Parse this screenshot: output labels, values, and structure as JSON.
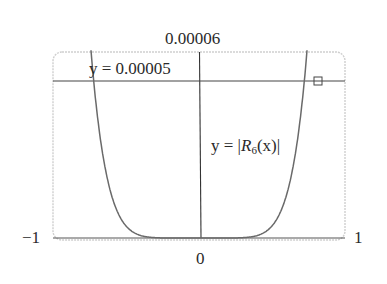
{
  "chart_data": {
    "type": "line",
    "title": "",
    "xlabel": "",
    "ylabel": "",
    "xlim": [
      -1,
      1
    ],
    "ylim": [
      0,
      6e-05
    ],
    "grid": false,
    "tick_labels": {
      "x_left": "−1",
      "x_right": "1",
      "x_origin": "0",
      "y_top": "0.00006"
    },
    "series": [
      {
        "name": "y = |R6(x)|",
        "label_prefix": "y = |",
        "label_R": "R",
        "label_sub": "6",
        "label_suffix": "(x)|",
        "x": [
          -0.75,
          -0.7,
          -0.6,
          -0.5,
          -0.4,
          -0.3,
          -0.2,
          -0.1,
          0,
          0.1,
          0.2,
          0.3,
          0.4,
          0.5,
          0.6,
          0.7,
          0.75
        ],
        "y": [
          6e-05,
          4.3e-05,
          2.15e-05,
          9.7e-06,
          4e-06,
          1.3e-06,
          2.5e-07,
          1e-08,
          0,
          1e-08,
          2.5e-07,
          1.3e-06,
          4e-06,
          9.7e-06,
          2.15e-05,
          4.3e-05,
          6e-05
        ]
      },
      {
        "name": "y = 0.00005",
        "label": "y = 0.00005",
        "x": [
          -1,
          1
        ],
        "y": [
          5e-05,
          5e-05
        ]
      }
    ],
    "annotations": [
      {
        "type": "intersection-marker",
        "x": 0.72,
        "y": 5e-05
      }
    ],
    "colors": {
      "curve": "#6a6a6a",
      "axis": "#333333",
      "frame": "#c8c8c8"
    }
  }
}
